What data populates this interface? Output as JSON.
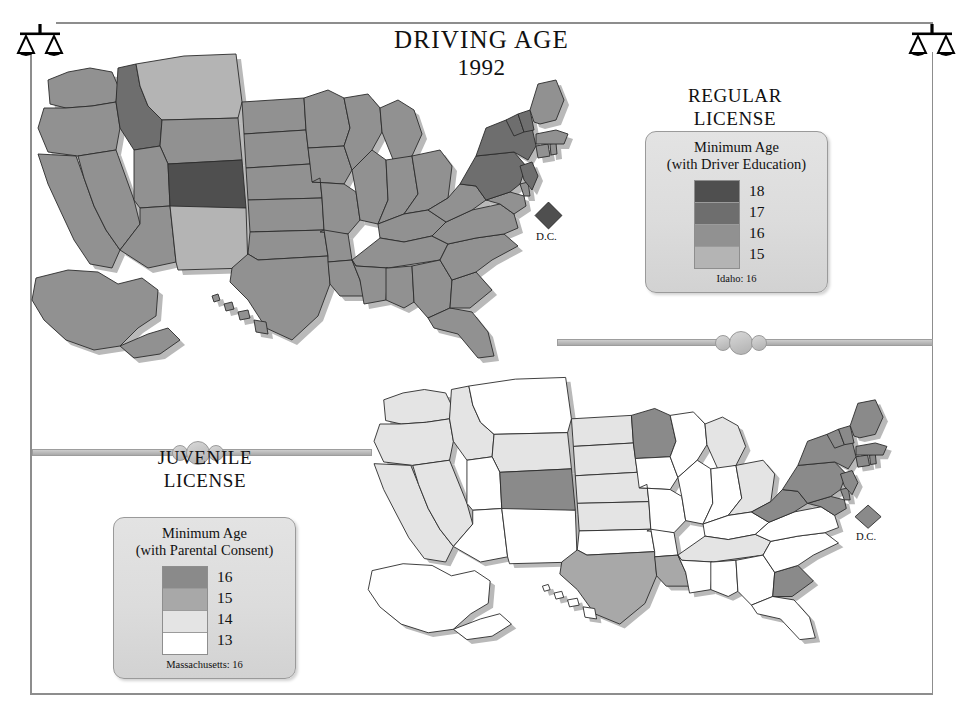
{
  "title": {
    "main": "DRIVING AGE",
    "year": "1992"
  },
  "icons": {
    "corner": "scales-of-justice-icon"
  },
  "legends": {
    "regular": {
      "heading": "REGULAR\nLICENSE",
      "heading_line1": "REGULAR",
      "heading_line2": "LICENSE",
      "subtitle_line1": "Minimum Age",
      "subtitle_line2": "(with Driver Education)",
      "entries": [
        {
          "label": "18",
          "color": "#4f4f4f"
        },
        {
          "label": "17",
          "color": "#6e6e6e"
        },
        {
          "label": "16",
          "color": "#919191"
        },
        {
          "label": "15",
          "color": "#b4b4b4"
        }
      ],
      "note": "Idaho: 16"
    },
    "juvenile": {
      "heading_line1": "JUVENILE",
      "heading_line2": "LICENSE",
      "subtitle_line1": "Minimum Age",
      "subtitle_line2": "(with Parental Consent)",
      "entries": [
        {
          "label": "16",
          "color": "#8a8a8a"
        },
        {
          "label": "15",
          "color": "#a8a8a8"
        },
        {
          "label": "14",
          "color": "#e4e4e4"
        },
        {
          "label": "13",
          "color": "#ffffff"
        }
      ],
      "note": "Massachusetts: 16"
    }
  },
  "map_labels": {
    "dc": "D.C."
  },
  "chart_data": {
    "type": "map",
    "title": "DRIVING AGE 1992",
    "maps": [
      {
        "name": "Regular License",
        "metric": "Minimum Age (with Driver Education)",
        "scale": [
          {
            "value": "18",
            "color": "#4f4f4f"
          },
          {
            "value": "17",
            "color": "#6e6e6e"
          },
          {
            "value": "16",
            "color": "#919191"
          },
          {
            "value": "15",
            "color": "#b4b4b4"
          }
        ],
        "note": "Idaho: 16",
        "values": {
          "WA": 16,
          "OR": 16,
          "CA": 16,
          "NV": 16,
          "ID": 17,
          "MT": 15,
          "WY": 16,
          "UT": 16,
          "CO": 18,
          "AZ": 16,
          "NM": 15,
          "ND": 16,
          "SD": 16,
          "NE": 16,
          "KS": 16,
          "OK": 16,
          "TX": 16,
          "MN": 16,
          "IA": 16,
          "MO": 16,
          "AR": 16,
          "LA": 16,
          "WI": 16,
          "IL": 16,
          "MI": 16,
          "IN": 16,
          "OH": 16,
          "KY": 16,
          "TN": 16,
          "MS": 16,
          "AL": 16,
          "GA": 16,
          "FL": 16,
          "SC": 16,
          "NC": 16,
          "VA": 16,
          "WV": 16,
          "MD": 16,
          "DE": 16,
          "PA": 17,
          "NJ": 17,
          "NY": 17,
          "CT": 16,
          "RI": 16,
          "MA": 16,
          "VT": 17,
          "NH": 17,
          "ME": 16,
          "AK": 16,
          "HI": 16,
          "DC": 18
        }
      },
      {
        "name": "Juvenile License",
        "metric": "Minimum Age (with Parental Consent)",
        "scale": [
          {
            "value": "16",
            "color": "#8a8a8a"
          },
          {
            "value": "15",
            "color": "#a8a8a8"
          },
          {
            "value": "14",
            "color": "#e4e4e4"
          },
          {
            "value": "13",
            "color": "#ffffff"
          }
        ],
        "note": "Massachusetts: 16",
        "values": {
          "WA": 14,
          "OR": 14,
          "CA": 14,
          "NV": 14,
          "ID": 14,
          "MT": 13,
          "WY": 14,
          "UT": 13,
          "CO": 16,
          "AZ": 13,
          "NM": 13,
          "ND": 14,
          "SD": 14,
          "NE": 14,
          "KS": 14,
          "OK": 13,
          "TX": 15,
          "MN": 16,
          "IA": 13,
          "MO": 13,
          "AR": 13,
          "LA": 15,
          "WI": 13,
          "IL": 13,
          "MI": 14,
          "IN": 13,
          "OH": 14,
          "KY": 13,
          "TN": 14,
          "MS": 13,
          "AL": 13,
          "GA": 13,
          "FL": 13,
          "SC": 16,
          "NC": 13,
          "VA": 13,
          "WV": 16,
          "MD": 16,
          "DE": 16,
          "PA": 16,
          "NJ": 16,
          "NY": 16,
          "CT": 16,
          "RI": 16,
          "MA": 16,
          "VT": 16,
          "NH": 16,
          "ME": 16,
          "AK": 13,
          "HI": 13,
          "DC": 16
        }
      }
    ]
  }
}
